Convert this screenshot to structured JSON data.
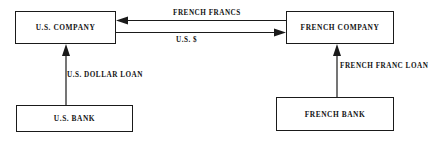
{
  "diagram": {
    "background_color": "#ffffff",
    "line_color": "#1a1a1a",
    "text_color": "#141414",
    "nodes": [
      {
        "id": "us_company",
        "label": "U.S. COMPANY"
      },
      {
        "id": "french_company",
        "label": "FRENCH COMPANY"
      },
      {
        "id": "us_bank",
        "label": "U.S. BANK"
      },
      {
        "id": "french_bank",
        "label": "FRENCH BANK"
      }
    ],
    "edges": [
      {
        "id": "french_francs",
        "label": "FRENCH FRANCS",
        "from": "french_company",
        "to": "us_company",
        "direction": "right-to-left"
      },
      {
        "id": "us_dollars",
        "label": "U.S. $",
        "from": "us_company",
        "to": "french_company",
        "direction": "left-to-right"
      },
      {
        "id": "us_dollar_loan",
        "label": "U.S. DOLLAR LOAN",
        "from": "us_bank",
        "to": "us_company",
        "direction": "bottom-to-top"
      },
      {
        "id": "french_franc_loan",
        "label": "FRENCH FRANC LOAN",
        "from": "french_bank",
        "to": "french_company",
        "direction": "bottom-to-top"
      }
    ]
  }
}
